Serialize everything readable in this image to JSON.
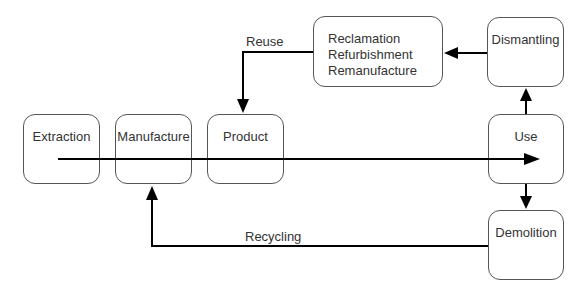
{
  "diagram": {
    "type": "flowchart",
    "title": "",
    "nodes": [
      {
        "id": "extraction",
        "label": "Extraction"
      },
      {
        "id": "manufacture",
        "label": "Manufacture"
      },
      {
        "id": "product",
        "label": "Product"
      },
      {
        "id": "use",
        "label": "Use"
      },
      {
        "id": "dismantling",
        "label": "Dismantling"
      },
      {
        "id": "reclamation",
        "lines": [
          "Reclamation",
          "Refurbishment",
          "Remanufacture"
        ]
      },
      {
        "id": "demolition",
        "label": "Demolition"
      }
    ],
    "edges": [
      {
        "from": "extraction",
        "to": "use",
        "label": "",
        "style": "main flow arrow through Manufacture and Product"
      },
      {
        "from": "use",
        "to": "dismantling",
        "label": ""
      },
      {
        "from": "dismantling",
        "to": "reclamation",
        "label": ""
      },
      {
        "from": "reclamation",
        "to": "product",
        "label": "Reuse"
      },
      {
        "from": "use",
        "to": "demolition",
        "label": ""
      },
      {
        "from": "demolition",
        "to": "manufacture",
        "label": "Recycling"
      }
    ],
    "edge_labels": {
      "reuse": "Reuse",
      "recycling": "Recycling"
    },
    "colors": {
      "stroke": "#000000",
      "box_border": "#555555",
      "text": "#333333",
      "background": "#ffffff"
    }
  }
}
